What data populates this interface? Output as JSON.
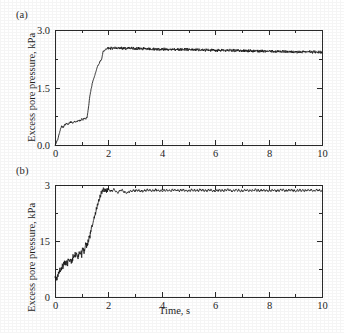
{
  "figure": {
    "panels": [
      {
        "tag": "(a)",
        "ylabel": "Excess pore pressure, kPa",
        "xlabel": "",
        "y_ticks": [
          "0.0",
          "1.5",
          "3.0"
        ],
        "x_ticks": [
          "0",
          "2",
          "4",
          "6",
          "8",
          "10"
        ]
      },
      {
        "tag": "(b)",
        "ylabel": "Excess pore pressure, kPa",
        "xlabel": "Time, s",
        "y_ticks": [
          "0",
          "15",
          "3"
        ],
        "x_ticks": [
          "0",
          "2",
          "4",
          "6",
          "8",
          "10"
        ]
      }
    ]
  },
  "chart_data": [
    {
      "type": "line",
      "panel": "(a)",
      "title": "",
      "xlabel": "",
      "ylabel": "Excess pore pressure, kPa",
      "xlim": [
        0,
        10
      ],
      "ylim": [
        0,
        3
      ],
      "xticks": [
        0,
        2,
        4,
        6,
        8,
        10
      ],
      "xticks_minor": [
        1,
        3,
        5,
        7,
        9
      ],
      "yticks": [
        0,
        1.5,
        3
      ],
      "yticks_minor": [
        0.75,
        2.25
      ],
      "ytick_labels": [
        "0.0",
        "1.5",
        "3.0"
      ],
      "grid": false,
      "legend": null,
      "line_color": "#151515",
      "description": "Excess pore pressure rises from 0 with a fast initial jump to ~0.5 kPa, holds a noisy stepped plateau near 0.6-0.75 kPa until t=1.2 s, then climbs steeply to ~2.5 kPa by t=1.9 s and remains on a noisy, slowly decaying plateau from 2.52 to 2.42 kPa out to t=10 s.",
      "series": [
        {
          "name": "Excess pore pressure (a)",
          "x": [
            0,
            0.1,
            0.18,
            0.25,
            0.3,
            0.36,
            0.42,
            0.5,
            0.58,
            0.66,
            0.72,
            0.8,
            0.88,
            0.95,
            1.0,
            1.05,
            1.1,
            1.15,
            1.2,
            1.25,
            1.3,
            1.35,
            1.4,
            1.45,
            1.5,
            1.55,
            1.6,
            1.65,
            1.7,
            1.75,
            1.8,
            1.85,
            1.9,
            2.0,
            2.2,
            2.5,
            3.0,
            3.5,
            4.0,
            4.5,
            5.0,
            5.5,
            6.0,
            6.5,
            7.0,
            7.5,
            8.0,
            8.5,
            9.0,
            9.5,
            10.0
          ],
          "y": [
            0.0,
            0.14,
            0.36,
            0.5,
            0.46,
            0.52,
            0.56,
            0.55,
            0.6,
            0.58,
            0.62,
            0.6,
            0.65,
            0.63,
            0.68,
            0.66,
            0.7,
            0.68,
            0.72,
            0.95,
            1.25,
            1.45,
            1.62,
            1.72,
            1.84,
            1.96,
            2.06,
            2.12,
            2.2,
            2.24,
            2.44,
            2.46,
            2.5,
            2.52,
            2.53,
            2.52,
            2.52,
            2.51,
            2.5,
            2.49,
            2.49,
            2.48,
            2.47,
            2.47,
            2.46,
            2.45,
            2.45,
            2.44,
            2.43,
            2.43,
            2.42
          ]
        }
      ]
    },
    {
      "type": "line",
      "panel": "(b)",
      "title": "",
      "xlabel": "Time, s",
      "ylabel": "Excess pore pressure, kPa",
      "xlim": [
        0,
        10
      ],
      "ylim": [
        0,
        3
      ],
      "xticks": [
        0,
        2,
        4,
        6,
        8,
        10
      ],
      "xticks_minor": [
        1,
        3,
        5,
        7,
        9
      ],
      "yticks": [
        0,
        1.5,
        3
      ],
      "yticks_minor": [
        0.75,
        2.25
      ],
      "ytick_labels": [
        "0",
        "15",
        "3"
      ],
      "grid": false,
      "legend": null,
      "line_color": "#151515",
      "description": "Excess pore pressure begins near 0.55 kPa, rises with strong ragged noise through 1.0-1.5 kPa up to t=1.3 s, then climbs steeply to about 2.9 kPa by t=1.8 s, overshoots with a damped ripple and settles on a flat slightly rippled plateau near 2.85 kPa to t=10 s.",
      "series": [
        {
          "name": "Excess pore pressure (b)",
          "x": [
            0,
            0.06,
            0.12,
            0.2,
            0.28,
            0.35,
            0.42,
            0.5,
            0.56,
            0.62,
            0.7,
            0.78,
            0.85,
            0.92,
            1.0,
            1.05,
            1.1,
            1.15,
            1.2,
            1.25,
            1.3,
            1.35,
            1.4,
            1.45,
            1.5,
            1.55,
            1.6,
            1.65,
            1.7,
            1.75,
            1.8,
            1.9,
            2.0,
            2.1,
            2.2,
            2.35,
            2.5,
            2.7,
            2.9,
            3.2,
            3.6,
            4.0,
            4.5,
            5.0,
            5.5,
            6.0,
            6.5,
            7.0,
            7.5,
            8.0,
            8.5,
            9.0,
            9.5,
            10.0
          ],
          "y": [
            0.6,
            0.5,
            0.62,
            0.75,
            0.82,
            0.9,
            0.86,
            0.96,
            1.02,
            0.96,
            1.08,
            1.14,
            1.08,
            1.2,
            1.14,
            1.32,
            1.22,
            1.42,
            1.36,
            1.52,
            1.62,
            1.8,
            1.92,
            2.08,
            2.2,
            2.34,
            2.48,
            2.6,
            2.72,
            2.8,
            2.88,
            2.84,
            2.9,
            2.82,
            2.88,
            2.8,
            2.86,
            2.78,
            2.86,
            2.84,
            2.86,
            2.85,
            2.86,
            2.85,
            2.86,
            2.85,
            2.86,
            2.85,
            2.86,
            2.85,
            2.86,
            2.85,
            2.86,
            2.85
          ]
        }
      ]
    }
  ]
}
